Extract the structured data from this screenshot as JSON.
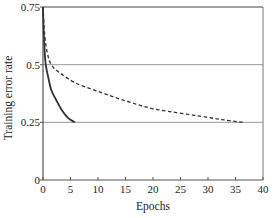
{
  "chart_data": {
    "type": "line",
    "title": "",
    "xlabel": "Epochs",
    "ylabel": "Training error rate",
    "xlim": [
      0,
      40
    ],
    "ylim": [
      0,
      0.75
    ],
    "x_ticks": [
      0,
      5,
      10,
      15,
      20,
      25,
      30,
      35,
      40
    ],
    "x_tick_labels": [
      "0",
      "5",
      "10",
      "15",
      "20",
      "25",
      "30",
      "35",
      "40"
    ],
    "y_ticks": [
      0,
      0.25,
      0.5,
      0.75
    ],
    "y_tick_labels": [
      "0",
      "0.25",
      "0.5",
      "0.75"
    ],
    "grid": {
      "horizontal": [
        0.25,
        0.5,
        0.75
      ],
      "vertical": false
    },
    "legend": null,
    "series": [
      {
        "name": "solid",
        "style": "solid",
        "color": "#333333",
        "x": [
          0,
          0.1,
          0.3,
          0.5,
          1.0,
          1.5,
          2.4,
          3.5,
          4.6,
          5.8
        ],
        "y": [
          0.75,
          0.66,
          0.56,
          0.5,
          0.44,
          0.39,
          0.347,
          0.3,
          0.268,
          0.25
        ]
      },
      {
        "name": "dashed",
        "style": "dashed",
        "color": "#333333",
        "x": [
          0,
          0.3,
          0.8,
          1.5,
          3.1,
          6.0,
          10.4,
          15.0,
          19.5,
          24.0,
          28.5,
          32.5,
          36.4
        ],
        "y": [
          0.75,
          0.63,
          0.55,
          0.5,
          0.464,
          0.42,
          0.381,
          0.343,
          0.312,
          0.293,
          0.277,
          0.262,
          0.25
        ]
      }
    ]
  }
}
